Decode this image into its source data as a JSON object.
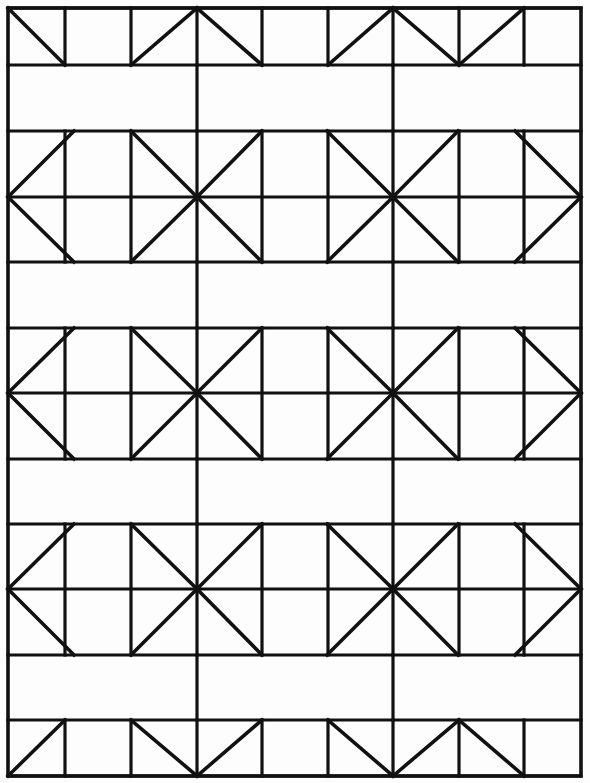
{
  "document": {
    "title": "Geometric Tiling Pattern",
    "type": "line-drawing",
    "description": "Black-and-white geometric quilt block diagram of triangles and star/pinwheel motifs on a rectangular grid",
    "width": 590,
    "height": 783
  },
  "style": {
    "background_color": "#fdfdfd",
    "line_color": "#111111",
    "grid_stroke_width": 3.2,
    "diagonal_stroke_width": 3.6,
    "border_stroke_width": 3.6
  },
  "geometry": {
    "columns_x": [
      8,
      65,
      131,
      197,
      262,
      328,
      393,
      459,
      524,
      581
    ],
    "rows_y": [
      8,
      65,
      131,
      197,
      262,
      328,
      393,
      459,
      524,
      589,
      655,
      720,
      776
    ],
    "column_count": 8,
    "band_count": 9
  },
  "bands": [
    {
      "name": "top-triangle-band",
      "kind": "triangle-row",
      "y_top": 8,
      "y_bottom": 65,
      "cells": [
        "backslash",
        "empty",
        "slash",
        "backslash",
        "empty",
        "slash",
        "backslash",
        "slash"
      ]
    },
    {
      "name": "blank-band-1",
      "kind": "blank-row",
      "y_top": 65,
      "y_bottom": 131,
      "internal_vertical_x": [
        197,
        393
      ]
    },
    {
      "name": "star-band-1",
      "kind": "star-row",
      "y_top": 131,
      "y_bottom": 262,
      "y_mid": 197,
      "star_centers_x": [
        197,
        393
      ],
      "left_half_star_x": 8,
      "right_half_star_x": 581
    },
    {
      "name": "blank-band-2",
      "kind": "blank-row",
      "y_top": 262,
      "y_bottom": 328,
      "internal_vertical_x": [
        197,
        393
      ]
    },
    {
      "name": "star-band-2",
      "kind": "star-row",
      "y_top": 328,
      "y_bottom": 459,
      "y_mid": 393,
      "star_centers_x": [
        197,
        393
      ],
      "left_half_star_x": 8,
      "right_half_star_x": 581
    },
    {
      "name": "blank-band-3",
      "kind": "blank-row",
      "y_top": 459,
      "y_bottom": 524,
      "internal_vertical_x": [
        197,
        393
      ]
    },
    {
      "name": "star-band-3",
      "kind": "star-row",
      "y_top": 524,
      "y_bottom": 655,
      "y_mid": 589,
      "star_centers_x": [
        197,
        393
      ],
      "left_half_star_x": 8,
      "right_half_star_x": 581
    },
    {
      "name": "blank-band-4",
      "kind": "blank-row",
      "y_top": 655,
      "y_bottom": 720,
      "internal_vertical_x": [
        197,
        393
      ]
    },
    {
      "name": "bottom-triangle-band",
      "kind": "triangle-row",
      "y_top": 720,
      "y_bottom": 776,
      "cells": [
        "slash",
        "empty",
        "backslash",
        "slash",
        "empty",
        "backslash",
        "slash",
        "backslash"
      ]
    }
  ]
}
